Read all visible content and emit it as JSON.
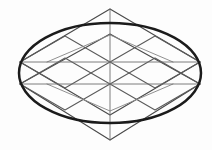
{
  "figure": {
    "background_color": "#fdfdfd",
    "canvas": {
      "width": 212,
      "height": 150
    }
  },
  "palette": {
    "lattice_stroke": "#5a5a5a",
    "lattice_faint_stroke": "#8a8a8a",
    "axis_stroke": "#6d6d6d",
    "ellipse_stroke": "#1b1b1b",
    "diamond_stroke": "#4a4a4a"
  },
  "geometry": {
    "center": {
      "x": 110,
      "y": 73
    },
    "top_vertex": {
      "x": 110,
      "y": 9
    },
    "bottom_vertex": {
      "x": 110,
      "y": 140
    },
    "left_vertex_upper": {
      "x": 20,
      "y": 62
    },
    "left_vertex_lower": {
      "x": 20,
      "y": 84
    },
    "right_vertex_upper": {
      "x": 200,
      "y": 62
    },
    "right_vertex_lower": {
      "x": 200,
      "y": 84
    },
    "horizontal_rail_upper_y": 62,
    "horizontal_rail_lower_y": 84,
    "vertical_axis_x": 110
  },
  "ellipse": {
    "center_x": 110,
    "center_y": 73,
    "radius_x": 91,
    "radius_y": 50,
    "stroke_width": 2.5,
    "label": "bold outer ellipse"
  },
  "diamonds": [
    {
      "name": "upper-rhombus",
      "points": "110,9 200,62 110,115 20,62"
    },
    {
      "name": "lower-rhombus",
      "points": "110,34 200,84 110,140 20,84"
    }
  ],
  "rails": [
    {
      "name": "upper-horizontal-rail",
      "y": 62,
      "x1": 20,
      "x2": 200
    },
    {
      "name": "lower-horizontal-rail",
      "y": 84,
      "x1": 20,
      "x2": 200
    }
  ],
  "axis": {
    "name": "vertical-axis",
    "x": 110,
    "y1": 9,
    "y2": 140
  },
  "lattice_segments": [
    {
      "name": "upper-zigzag-left-down",
      "points": "20,62 65,36 110,62 155,36 200,62"
    },
    {
      "name": "upper-zigzag-left-up",
      "points": "20,62 65,88 110,62 155,88 200,62"
    },
    {
      "name": "lower-zigzag-left-down",
      "points": "20,84 65,58 110,84 155,58 200,84"
    },
    {
      "name": "lower-zigzag-left-up",
      "points": "20,84 65,110 110,84 155,110 200,84"
    },
    {
      "name": "inner-chevron-upper",
      "points": "47,62 110,35 173,62"
    },
    {
      "name": "inner-chevron-lower",
      "points": "47,84 110,111 173,84"
    },
    {
      "name": "mid-cross-left",
      "points": "65,36 65,110"
    },
    {
      "name": "mid-cross-right",
      "points": "155,36 155,110"
    }
  ],
  "stats": {
    "diamond_count": 2,
    "rail_count": 2,
    "ellipse_count": 1,
    "vertex_count": 6
  }
}
